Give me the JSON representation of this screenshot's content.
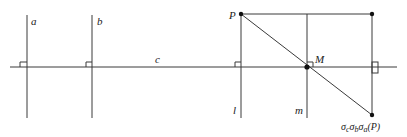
{
  "diagram": {
    "lines": {
      "a": "a",
      "b": "b",
      "c": "c",
      "l": "l",
      "m": "m"
    },
    "points": {
      "P": "P",
      "M": "M",
      "image": "σ_c σ_b σ_a (P)"
    },
    "image_label_parts": {
      "s1": "σ",
      "sub1": "c",
      "s2": "σ",
      "sub2": "b",
      "s3": "σ",
      "sub3": "a",
      "arg": "(P)"
    },
    "colors": {
      "stroke": "#3a3a3a",
      "text": "#222222",
      "background": "#ffffff"
    }
  }
}
